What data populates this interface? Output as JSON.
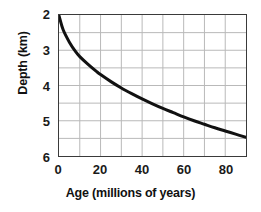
{
  "chart_data": {
    "type": "line",
    "title": "",
    "subtitle": "",
    "xlabel": "Age (millions of years)",
    "ylabel": "Depth (km)",
    "xlim": [
      0,
      90
    ],
    "ylim": [
      2,
      6
    ],
    "y_inverted": true,
    "grid": true,
    "legend": null,
    "legend_position": "none",
    "x_ticks": [
      0,
      20,
      40,
      60,
      80
    ],
    "x_tick_labels": [
      "0",
      "20",
      "40",
      "60",
      "80"
    ],
    "y_ticks": [
      2,
      3,
      4,
      5,
      6
    ],
    "y_tick_labels": [
      "2",
      "3",
      "4",
      "5",
      "6"
    ],
    "x_gridlines": [
      0,
      10,
      20,
      30,
      40,
      50,
      60,
      70,
      80,
      90
    ],
    "y_gridlines": [
      2,
      2.5,
      3,
      3.5,
      4,
      4.5,
      5,
      5.5,
      6
    ],
    "series": [
      {
        "name": "Ocean floor depth vs age",
        "color": "#111111",
        "line_width": 3,
        "x": [
          0,
          2,
          5,
          8,
          10,
          14,
          18,
          20,
          25,
          30,
          35,
          40,
          45,
          50,
          55,
          60,
          65,
          70,
          75,
          80,
          85,
          90
        ],
        "y": [
          2.02,
          2.42,
          2.77,
          3.04,
          3.18,
          3.4,
          3.6,
          3.69,
          3.89,
          4.07,
          4.23,
          4.38,
          4.52,
          4.65,
          4.77,
          4.89,
          5.0,
          5.1,
          5.2,
          5.29,
          5.38,
          5.47
        ]
      }
    ],
    "annotations": []
  },
  "style": {
    "axis_color": "#3a3a3a",
    "grid_color": "#b9b9b9",
    "curve_color": "#111111",
    "text_color": "#1a1a1a",
    "background": "#ffffff"
  }
}
